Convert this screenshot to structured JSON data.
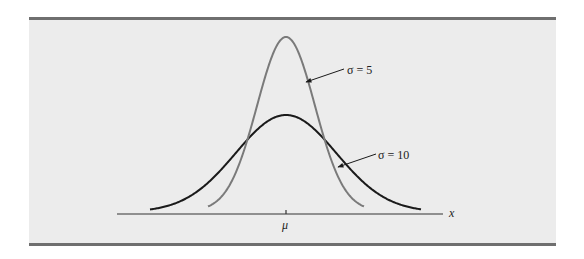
{
  "chart_data": {
    "type": "line",
    "title": "",
    "xlabel": "x",
    "ylabel": "",
    "x_ticks": [
      {
        "position": "center",
        "label": "μ"
      }
    ],
    "grid": false,
    "legend": null,
    "series": [
      {
        "name": "σ = 5",
        "distribution": "normal",
        "mean_label": "μ",
        "sigma": 5,
        "color": "#7a7a7a",
        "relative_peak_height": 1.0,
        "pixel": {
          "center_x": 286,
          "peak_y": 37,
          "start_x": 208,
          "end_x": 364,
          "baseline_y": 211
        }
      },
      {
        "name": "σ = 10",
        "distribution": "normal",
        "mean_label": "μ",
        "sigma": 10,
        "color": "#1a1a1a",
        "relative_peak_height": 0.56,
        "pixel": {
          "center_x": 286,
          "peak_y": 115,
          "start_x": 150,
          "end_x": 421,
          "baseline_y": 212
        }
      }
    ],
    "annotations": [
      {
        "text": "σ = 5",
        "target_series": "σ = 5",
        "type": "arrow-label"
      },
      {
        "text": "σ = 10",
        "target_series": "σ = 10",
        "type": "arrow-label"
      }
    ]
  },
  "labels": {
    "sigma5": "σ = 5",
    "sigma10": "σ = 10",
    "mu": "μ",
    "x_axis": "x"
  },
  "colors": {
    "panel_bg": "#ececec",
    "rule": "#6f6f6f",
    "sigma5_curve": "#7a7a7a",
    "sigma10_curve": "#1a1a1a",
    "axis": "#333333"
  }
}
